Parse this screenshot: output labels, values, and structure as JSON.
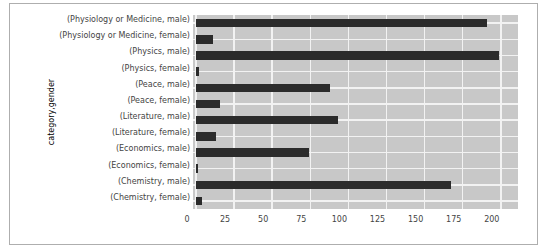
{
  "figure": {
    "border_color": "#aeaeae",
    "background": "#ffffff"
  },
  "chart_data": {
    "type": "bar",
    "orientation": "horizontal",
    "title": "",
    "xlabel": "",
    "ylabel": "category,gender",
    "categories": [
      "(Physiology or Medicine, male)",
      "(Physiology or Medicine, female)",
      "(Physics, male)",
      "(Physics, female)",
      "(Peace, male)",
      "(Peace, female)",
      "(Literature, male)",
      "(Literature, female)",
      "(Economics, male)",
      "(Economics, female)",
      "(Chemistry, male)",
      "(Chemistry, female)"
    ],
    "values": [
      191,
      11,
      199,
      2,
      88,
      16,
      93,
      13,
      74,
      1,
      167,
      4
    ],
    "xticks": [
      0,
      25,
      50,
      75,
      100,
      125,
      150,
      175,
      200
    ],
    "xlim": [
      0,
      211
    ],
    "grid": true,
    "legend": "none",
    "colors": {
      "bar": "#2b2b2b",
      "plot_background": "#c8c8c8",
      "gridline": "#f2f2f2",
      "text": "#444444"
    }
  }
}
